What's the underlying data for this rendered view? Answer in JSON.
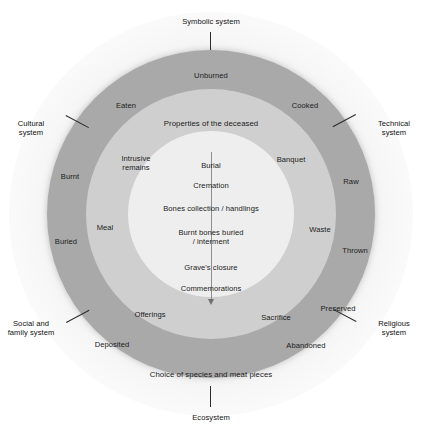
{
  "diagram": {
    "colors": {
      "outer_ring": "#a9a9a9",
      "middle_ring": "#cfcfcf",
      "inner_circle": "#eeeeee",
      "background": "#ffffff",
      "text": "#1c1c1c"
    }
  },
  "systems": [
    {
      "id": "symbolic",
      "label": "Symbolic system",
      "position": "top"
    },
    {
      "id": "technical",
      "label": "Technical\nsystem",
      "position": "upper-right"
    },
    {
      "id": "religious",
      "label": "Religious\nsystem",
      "position": "lower-right"
    },
    {
      "id": "ecosystem",
      "label": "Ecosystem",
      "position": "bottom"
    },
    {
      "id": "social-family",
      "label": "Social and\nfamily system",
      "position": "lower-left"
    },
    {
      "id": "cultural",
      "label": "Cultural\nsystem",
      "position": "upper-left"
    }
  ],
  "outer_ring": {
    "band_label": "Choice of species and meat pieces",
    "items": [
      {
        "label": "Unburned"
      },
      {
        "label": "Cooked"
      },
      {
        "label": "Raw"
      },
      {
        "label": "Thrown"
      },
      {
        "label": "Preserved"
      },
      {
        "label": "Abandoned"
      },
      {
        "label": "Deposited"
      },
      {
        "label": "Buried"
      },
      {
        "label": "Burnt"
      },
      {
        "label": "Eaten"
      }
    ]
  },
  "middle_ring": {
    "band_label": "Properties of the deceased",
    "items": [
      {
        "label": "Intrusive\nremains"
      },
      {
        "label": "Banquet"
      },
      {
        "label": "Waste"
      },
      {
        "label": "Sacrifice"
      },
      {
        "label": "Offerings"
      },
      {
        "label": "Meal"
      }
    ]
  },
  "inner_circle": {
    "sequence": [
      {
        "step": 1,
        "label": "Burial"
      },
      {
        "step": 2,
        "label": "Cremation"
      },
      {
        "step": 3,
        "label": "Bones collection / handlings"
      },
      {
        "step": 4,
        "label": "Burnt bones buried\n/ interment"
      },
      {
        "step": 5,
        "label": "Grave's closure"
      },
      {
        "step": 6,
        "label": "Commemorations"
      }
    ]
  }
}
